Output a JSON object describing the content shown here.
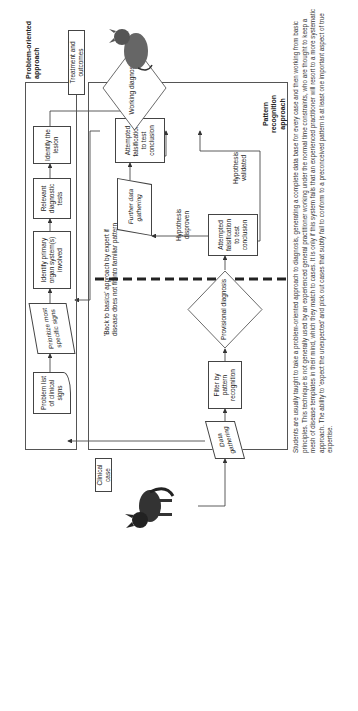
{
  "diagram": {
    "start_label": "Clinical case",
    "end_label": "Treatment and outcomes",
    "problem_oriented": {
      "title": "Problem-oriented approach",
      "steps": [
        "Problem list of clinical signs",
        "Prioritize most specific signs",
        "Identify primary organ system(s) involved",
        "Relevant diagnostic tests",
        "Identify the lesion"
      ]
    },
    "pattern_recognition": {
      "title": "Pattern recognition approach",
      "data_gathering": "Data gathering",
      "filter": "Filter by pattern recognition",
      "provisional": "Provisional diagnosis",
      "falsification_1": "Attempted falsification to test conclusion",
      "further_data": "Further data gathering",
      "falsification_2": "Attempted falsification to test conclusion",
      "working": "Working diagnosis",
      "hypothesis_disproven": "Hypothesis disproven",
      "hypothesis_validated": "Hypothesis validated",
      "back_to_basics": "'Back to basics' approach by expert if disease does not fit into familiar pattern"
    },
    "caption": "Students are usually taught to take a problem-oriented approach to diagnosis, generating a complete data base for every case and then working from basic principles. This technique is not generally used by an experienced general practitioner working under the normal time constraints, who are thought to keep a mesh of disease templates in their mind, which they match to cases. It is only if this system fails that an experienced practitioner will resort to a more systematic approach. The ability to 'expect the unexpected' and pick out cases that subtly fail to conform to a preconceived pattern is at least one important aspect of true expertise."
  }
}
